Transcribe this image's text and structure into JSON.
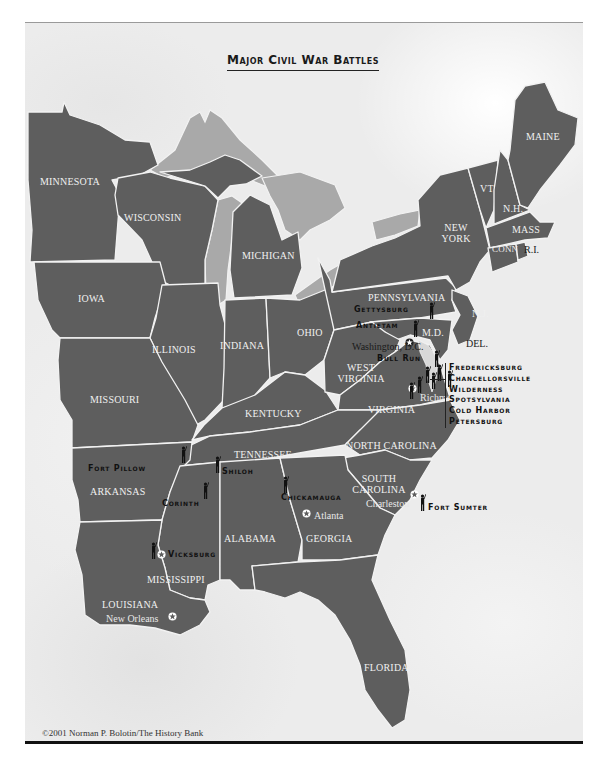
{
  "title": "Major Civil War Battles",
  "colors": {
    "state_fill": "#5e5e5e",
    "lake_fill": "#a9a9a9",
    "border": "#f2f2f2",
    "background": "#ececec",
    "battle_text": "#111111"
  },
  "states": {
    "minnesota": "MINNESOTA",
    "wisconsin": "WISCONSIN",
    "michigan": "MICHIGAN",
    "iowa": "IOWA",
    "illinois": "ILLINOIS",
    "indiana": "INDIANA",
    "ohio": "OHIO",
    "missouri": "MISSOURI",
    "kentucky": "KENTUCKY",
    "west_virginia": "WEST VIRGINIA",
    "virginia": "VIRGINIA",
    "pennsylvania": "PENNSYLVANIA",
    "new_york": "NEW YORK",
    "vermont": "VT",
    "new_hampshire": "N.H.",
    "maine": "MAINE",
    "massachusetts": "MASS",
    "connecticut": "CONN",
    "rhode_island": "R.I.",
    "new_jersey": "N.J.",
    "delaware": "DEL.",
    "maryland": "M.D.",
    "tennessee": "TENNESSEE",
    "north_carolina": "NORTH CAROLINA",
    "south_carolina": "SOUTH CAROLINA",
    "arkansas": "ARKANSAS",
    "mississippi": "MISSISSIPPI",
    "alabama": "ALABAMA",
    "georgia": "GEORGIA",
    "louisiana": "LOUISIANA",
    "florida": "FLORIDA"
  },
  "cities": {
    "washington": "Washington, D.C.",
    "richmond": "Richmond",
    "atlanta": "Atlanta",
    "charleston": "Charleston",
    "new_orleans": "New Orleans"
  },
  "battles": {
    "gettysburg": "Gettysburg",
    "antietam": "Antietam",
    "bull_run": "Bull Run",
    "fort_pillow": "Fort Pillow",
    "shiloh": "Shiloh",
    "corinth": "Corinth",
    "chickamauga": "Chickamauga",
    "fort_sumter": "Fort Sumter",
    "vicksburg": "Vicksburg",
    "virginia_list": [
      "Fredericksburg",
      "Chancellorsville",
      "Wilderness",
      "Spotsylvania",
      "Cold Harbor",
      "Petersburg"
    ]
  },
  "copyright": "©2001 Norman P. Bolotin/The History Bank"
}
